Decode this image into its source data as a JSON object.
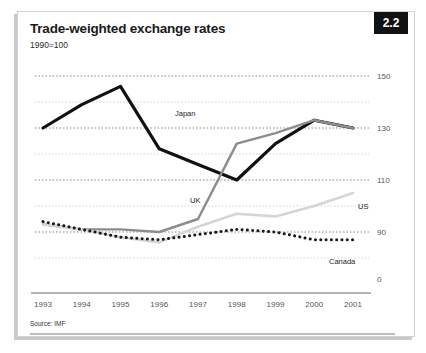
{
  "figure": {
    "badge": "2.2",
    "title": "Trade-weighted exchange rates",
    "subtitle": "1990=100",
    "source": "Source: IMF"
  },
  "chart_data": {
    "type": "line",
    "title": "Trade-weighted exchange rates",
    "subtitle": "1990=100",
    "xlabel": "",
    "ylabel": "",
    "categories": [
      "1993",
      "1994",
      "1995",
      "1996",
      "1997",
      "1998",
      "1999",
      "2000",
      "2001"
    ],
    "x_tick_labels": [
      "1993",
      "1994",
      "1995",
      "1996",
      "1997",
      "1998",
      "1999",
      "2000",
      "2001"
    ],
    "y_tick_labels": [
      "150",
      "130",
      "110",
      "90",
      "0"
    ],
    "y_major_ticks": [
      150,
      130,
      110,
      90
    ],
    "y_minor_gridlines": [
      140,
      120,
      100,
      80
    ],
    "ylim": [
      70,
      155
    ],
    "grid": true,
    "grid_style": "dotted-horizontal",
    "legend": "inline-labels",
    "series": [
      {
        "name": "Japan",
        "style": "solid-thick-black",
        "color": "#111111",
        "values": [
          130,
          139,
          146,
          122,
          116,
          110,
          124,
          133,
          130
        ],
        "label_x": "1996",
        "label_text": "Japan"
      },
      {
        "name": "UK",
        "style": "solid-medium-gray",
        "color": "#8c8c8c",
        "values": [
          93,
          91,
          91,
          90,
          95,
          124,
          128,
          133,
          130
        ],
        "label_x": "1997",
        "label_text": "UK"
      },
      {
        "name": "US",
        "style": "solid-light-gray",
        "color": "#d5d5d5",
        "values": [
          93,
          91,
          88,
          86,
          92,
          97,
          96,
          100,
          105
        ],
        "label_x": "2001",
        "label_text": "US"
      },
      {
        "name": "Canada",
        "style": "dotted-black",
        "color": "#1a1a1a",
        "values": [
          94,
          91,
          88,
          87,
          89,
          91,
          90,
          87,
          87
        ],
        "label_x": "2000",
        "label_text": "Canada"
      }
    ],
    "series_labels": [
      "Japan",
      "UK",
      "US",
      "Canada"
    ]
  }
}
